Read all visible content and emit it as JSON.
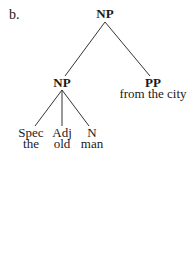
{
  "example_label": "b.",
  "tree": {
    "root": {
      "category": "NP",
      "children": [
        "np_inner",
        "pp"
      ]
    },
    "np_inner": {
      "category": "NP",
      "children": [
        "spec",
        "adj",
        "n"
      ]
    },
    "pp": {
      "category": "PP",
      "words": "from the city"
    },
    "spec": {
      "category": "Spec",
      "words": "the"
    },
    "adj": {
      "category": "Adj",
      "words": "old"
    },
    "n": {
      "category": "N",
      "words": "man"
    }
  },
  "colors": {
    "text": "#1a1a1a",
    "lines": "#333333",
    "background": "#ffffff"
  }
}
